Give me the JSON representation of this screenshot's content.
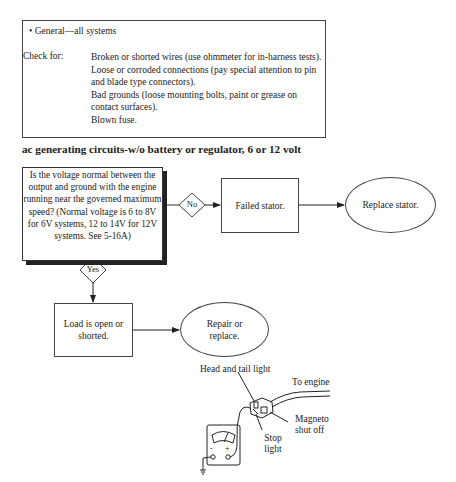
{
  "check_box": {
    "bullet_heading": "• General—all systems",
    "check_label": "Check for:",
    "items": [
      "Broken or shorted wires (use ohmmeter for in-harness tests).",
      "Loose or corroded connections (pay special attention to pin and blade type connectors).",
      "Bad grounds (loose mounting bolts, paint or grease on contact surfaces).",
      "Blown fuse."
    ]
  },
  "section_title": "ac generating circuits-w/o battery or regulator, 6 or 12 volt",
  "flowchart": {
    "question": "Is the voltage normal between the output and ground with the engine running near the governed maximum speed? (Normal voltage is 6 to 8V for 6V systems, 12 to 14V for 12V systems. See 5-16A)",
    "no_label": "No",
    "yes_label": "Yes",
    "no_result": "Failed stator.",
    "no_action": "Replace stator.",
    "yes_result": "Load is open or shorted.",
    "yes_action": "Repair or replace."
  },
  "illustration": {
    "labels": {
      "head_tail": "Head and tail light",
      "to_engine": "To engine",
      "magneto": "Magneto shut off",
      "stop": "Stop light"
    },
    "meter_minus": "-",
    "meter_plus": "+"
  }
}
